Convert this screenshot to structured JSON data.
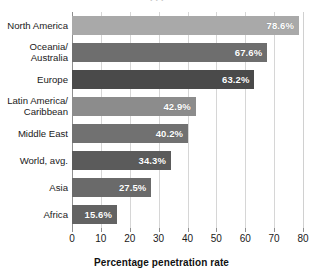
{
  "clipped_top_text": "...",
  "chart_data": {
    "type": "bar",
    "orientation": "horizontal",
    "title": "",
    "xlabel": "Percentage penetration rate",
    "ylabel": "",
    "xlim": [
      0,
      80
    ],
    "xticks": [
      0,
      10,
      20,
      30,
      40,
      50,
      60,
      70,
      80
    ],
    "grid": true,
    "legend": false,
    "value_label_format": "{v}%",
    "categories": [
      "North America",
      "Oceania/\nAustralia",
      "Europe",
      "Latin America/\nCaribbean",
      "Middle East",
      "World, avg.",
      "Asia",
      "Africa"
    ],
    "values": [
      78.6,
      67.6,
      63.2,
      42.9,
      40.2,
      34.3,
      27.5,
      15.6
    ],
    "value_labels": [
      "78.6%",
      "67.6%",
      "63.2%",
      "42.9%",
      "40.2%",
      "34.3%",
      "27.5%",
      "15.6%"
    ],
    "bar_colors": [
      "#a9a9a9",
      "#6e6e6e",
      "#4a4a4a",
      "#8c8c8c",
      "#717171",
      "#5b5b5b",
      "#6a6a6a",
      "#636363"
    ],
    "axis_color": "#8f8f8f",
    "gridline_color": "#d6d6d6",
    "value_text_color": "#ffffff"
  }
}
